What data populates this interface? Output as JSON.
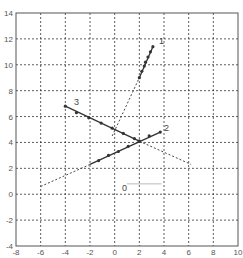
{
  "chart_data": {
    "type": "line",
    "title": "",
    "xlabel": "",
    "ylabel": "",
    "xlim": [
      -8,
      10
    ],
    "ylim": [
      -4,
      14
    ],
    "xticks": [
      -8,
      -6,
      -4,
      -2,
      0,
      2,
      4,
      6,
      8,
      10
    ],
    "yticks": [
      -4,
      -2,
      0,
      2,
      4,
      6,
      8,
      10,
      12,
      14
    ],
    "grid": true,
    "legend": "none",
    "series": [
      {
        "name": "0",
        "label_pos": [
          0.6,
          0.5
        ],
        "solid": [
          [
            1.0,
            0.8
          ],
          [
            3.8,
            0.8
          ]
        ],
        "markers": [],
        "dashed": []
      },
      {
        "name": "1",
        "label_pos": [
          3.6,
          11.8
        ],
        "solid": [
          [
            2.0,
            9.0
          ],
          [
            3.1,
            11.4
          ]
        ],
        "markers": [
          [
            2.0,
            9.0
          ],
          [
            2.2,
            9.5
          ],
          [
            2.4,
            9.9
          ],
          [
            2.5,
            10.2
          ],
          [
            2.7,
            10.6
          ],
          [
            2.9,
            11.0
          ],
          [
            3.1,
            11.4
          ]
        ],
        "dashed": [
          [
            -0.2,
            4.5
          ],
          [
            2.0,
            9.0
          ]
        ]
      },
      {
        "name": "2",
        "label_pos": [
          4.0,
          5.1
        ],
        "solid": [
          [
            -2.0,
            2.3
          ],
          [
            3.7,
            4.8
          ]
        ],
        "markers": [
          [
            -1.3,
            2.6
          ],
          [
            -0.5,
            3.0
          ],
          [
            0.3,
            3.3
          ],
          [
            1.1,
            3.7
          ],
          [
            2.0,
            4.1
          ],
          [
            2.8,
            4.5
          ],
          [
            3.7,
            4.8
          ]
        ],
        "dashed": [
          [
            -6.0,
            0.6
          ],
          [
            -2.0,
            2.3
          ]
        ]
      },
      {
        "name": "3",
        "label_pos": [
          -3.3,
          7.1
        ],
        "solid": [
          [
            -4.0,
            6.8
          ],
          [
            2.0,
            4.1
          ]
        ],
        "markers": [
          [
            -4.0,
            6.8
          ],
          [
            -3.1,
            6.3
          ],
          [
            -2.1,
            5.9
          ],
          [
            -1.1,
            5.5
          ],
          [
            -0.2,
            5.1
          ],
          [
            0.7,
            4.7
          ],
          [
            1.6,
            4.3
          ],
          [
            2.0,
            4.1
          ]
        ],
        "dashed": [
          [
            2.0,
            4.1
          ],
          [
            6.2,
            2.3
          ]
        ]
      }
    ]
  },
  "colors": {
    "axis": "#555555",
    "grid": "#333333",
    "line": "#333333",
    "faint_line": "#bbbbbb",
    "tick_text": "#555555"
  }
}
